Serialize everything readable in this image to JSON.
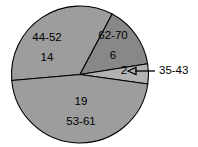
{
  "chart_data": {
    "type": "pie",
    "title": "",
    "subtitle": "",
    "xlabel": "",
    "ylabel": "",
    "legend_position": "none",
    "grid": false,
    "total": 41,
    "categories": [
      "44-52",
      "62-70",
      "35-43",
      "53-61"
    ],
    "values": [
      14,
      6,
      2,
      19
    ],
    "slices": [
      {
        "category": "44-52",
        "value": 14,
        "value_text": "14",
        "label_text": "44-52",
        "color": "#9d9d9d",
        "label_placement": "inside",
        "label_order": "category-then-value",
        "start_angle_deg": -62,
        "end_angle_deg": -185
      },
      {
        "category": "62-70",
        "value": 6,
        "value_text": "6",
        "label_text": "62-70",
        "color": "#888888",
        "label_placement": "inside",
        "label_order": "category-then-value",
        "start_angle_deg": -62,
        "end_angle_deg": -9
      },
      {
        "category": "35-43",
        "value": 2,
        "value_text": "2",
        "label_text": "35-43",
        "color": "#b3b3b3",
        "label_placement": "callout",
        "label_order": "value-inside-category-outside",
        "start_angle_deg": -9,
        "end_angle_deg": 8
      },
      {
        "category": "53-61",
        "value": 19,
        "value_text": "19",
        "label_text": "53-61",
        "color": "#9d9d9d",
        "label_placement": "inside",
        "label_order": "value-then-category",
        "start_angle_deg": 8,
        "end_angle_deg": 175
      }
    ],
    "style": {
      "background": "#ffffff",
      "outline_color": "#000000",
      "text_color": "#000000",
      "center_x": 80,
      "center_y": 74.5,
      "radius": 68.5
    },
    "callout": {
      "label": "35-43",
      "arrow_tip_x": 128,
      "arrow_tip_y": 71,
      "elbow_x": 155,
      "text_x": 159,
      "text_y": 71
    }
  }
}
